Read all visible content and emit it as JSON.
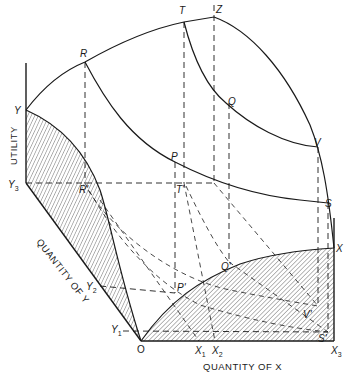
{
  "diagram": {
    "axes": {
      "utility": "UTILITY",
      "quantity_y": "QUANTITY OF Y",
      "quantity_x": "QUANTITY OF X"
    },
    "points": {
      "R": "R",
      "T": "T",
      "Z": "Z",
      "Q": "Q",
      "V": "V",
      "S": "S",
      "P": "P",
      "Y": "Y",
      "X": "X",
      "O": "O",
      "R_prime": "R'",
      "T_prime": "T'",
      "P_prime": "P'",
      "Q_prime": "Q'",
      "V_prime": "V'",
      "S_prime": "S'"
    },
    "ticks": {
      "Y3": {
        "base": "Y",
        "sub": "3"
      },
      "Y2": {
        "base": "Y",
        "sub": "2"
      },
      "Y1": {
        "base": "Y",
        "sub": "1"
      },
      "X1": {
        "base": "X",
        "sub": "1"
      },
      "X2": {
        "base": "X",
        "sub": "2"
      },
      "X3": {
        "base": "X",
        "sub": "3"
      }
    },
    "colors": {
      "ink": "#1a1a1a",
      "background": "#ffffff"
    }
  }
}
